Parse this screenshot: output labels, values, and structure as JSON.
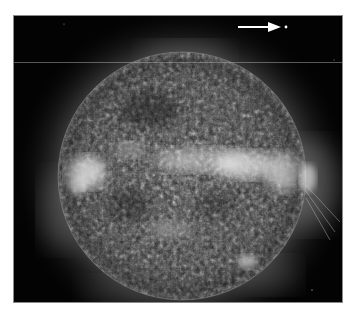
{
  "image": {
    "subject": "Full-disk image of the Sun in extreme ultraviolet (grayscale)",
    "background_color": "#ffffff",
    "frame_color": "#020202",
    "frame": {
      "x": 13,
      "y": 15,
      "width": 330,
      "height": 288
    },
    "sun_disk": {
      "cx": 182,
      "cy": 176,
      "r": 124
    },
    "annotations": {
      "arrow": {
        "x1": 238,
        "y1": 27,
        "x2": 280,
        "y2": 27,
        "color": "#ffffff",
        "icon": "arrow-right-icon"
      },
      "marker_dot": {
        "cx": 286,
        "cy": 27,
        "color": "#ffffff"
      }
    },
    "bright_regions": [
      {
        "name": "active-region-left-limb",
        "cx": 86,
        "cy": 172
      },
      {
        "name": "active-region-center-band",
        "cx": 245,
        "cy": 165
      },
      {
        "name": "active-region-right-limb",
        "cx": 305,
        "cy": 180
      },
      {
        "name": "bright-point-lower-right",
        "cx": 248,
        "cy": 262
      }
    ],
    "horizontal_artifact_line_y": 62
  }
}
